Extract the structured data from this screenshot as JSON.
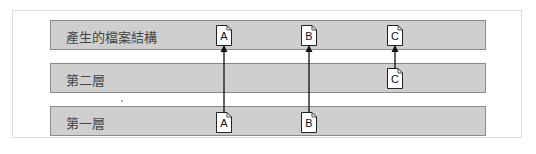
{
  "diagram": {
    "layers": [
      {
        "id": "result",
        "label": "產生的檔案結構",
        "top": 20
      },
      {
        "id": "layer2",
        "label": "第二層",
        "top": 63
      },
      {
        "id": "layer1",
        "label": "第一層",
        "top": 106
      }
    ],
    "files": [
      {
        "label": "A",
        "layer": "result",
        "x": 216,
        "y": 25
      },
      {
        "label": "B",
        "layer": "result",
        "x": 301,
        "y": 25
      },
      {
        "label": "C",
        "layer": "result",
        "x": 387,
        "y": 25
      },
      {
        "label": "C",
        "layer": "layer2",
        "x": 387,
        "y": 68
      },
      {
        "label": "A",
        "layer": "layer1",
        "x": 216,
        "y": 112
      },
      {
        "label": "B",
        "layer": "layer1",
        "x": 301,
        "y": 112
      }
    ],
    "arrows": [
      {
        "from": "A (第一層)",
        "to": "A (產生的檔案結構)",
        "x": 224,
        "y1": 112,
        "y2": 46
      },
      {
        "from": "B (第一層)",
        "to": "B (產生的檔案結構)",
        "x": 309,
        "y1": 112,
        "y2": 46
      },
      {
        "from": "C (第二層)",
        "to": "C (產生的檔案結構)",
        "x": 395,
        "y1": 68,
        "y2": 46
      }
    ],
    "colors": {
      "layer_fill": "#cfcfcf",
      "layer_border": "#8a8a8a",
      "arrow": "#111111",
      "frame_border": "#dcdcdc"
    }
  }
}
